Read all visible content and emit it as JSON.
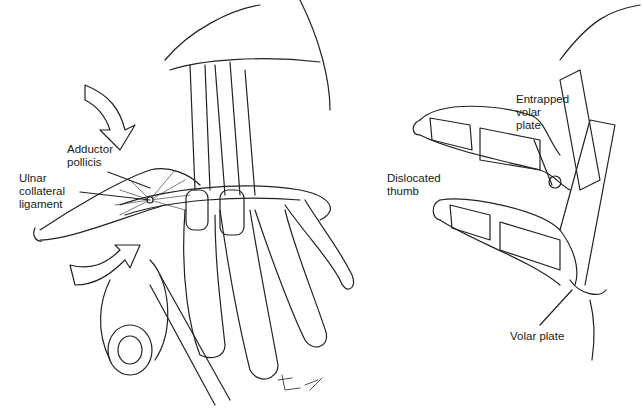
{
  "figure": {
    "panels": {
      "left": {
        "description": "Hand gripping a cylindrical handle with thumb abducted"
      },
      "right": {
        "title": "Dislocated thumb"
      }
    },
    "labels": {
      "adductor_pollicis": "Adductor\npollicis",
      "ulnar_collateral_ligament": "Ulnar\ncollateral\nligament",
      "dislocated_thumb": "Dislocated\nthumb",
      "entrapped_volar_plate": "Entrapped\nvolar\nplate",
      "volar_plate": "Volar plate"
    },
    "signature": "Bax"
  }
}
